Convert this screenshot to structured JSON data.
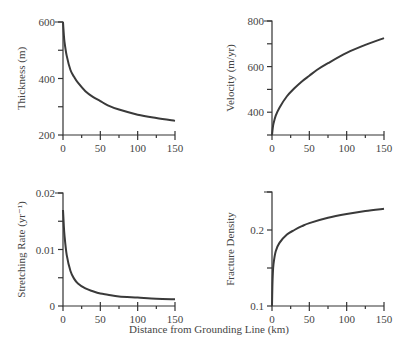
{
  "figure": {
    "shared_xlabel": "Distance from Grounding Line (km)"
  },
  "chart_data": [
    {
      "type": "line",
      "title": "",
      "xlabel": "Distance from Grounding Line (km)",
      "ylabel": "Thickness (m)",
      "xlim": [
        0,
        150
      ],
      "ylim": [
        200,
        600
      ],
      "xticks": [
        "0",
        "50",
        "100",
        "150"
      ],
      "yticks": [
        "200",
        "400",
        "600"
      ],
      "grid": false,
      "x": [
        0,
        1,
        2,
        5,
        10,
        15,
        20,
        30,
        40,
        50,
        60,
        75,
        100,
        125,
        150
      ],
      "y": [
        600,
        560,
        530,
        480,
        430,
        405,
        385,
        355,
        335,
        320,
        305,
        290,
        272,
        260,
        250
      ]
    },
    {
      "type": "line",
      "title": "",
      "xlabel": "Distance from Grounding Line (km)",
      "ylabel": "Velocity (m/yr)",
      "xlim": [
        0,
        150
      ],
      "ylim": [
        300,
        800
      ],
      "xticks": [
        "0",
        "50",
        "100",
        "150"
      ],
      "yticks": [
        "400",
        "600",
        "800"
      ],
      "grid": false,
      "x": [
        0,
        1,
        2,
        5,
        10,
        20,
        30,
        40,
        50,
        60,
        75,
        100,
        125,
        150
      ],
      "y": [
        300,
        330,
        350,
        385,
        420,
        470,
        505,
        535,
        560,
        585,
        615,
        660,
        695,
        725
      ]
    },
    {
      "type": "line",
      "title": "",
      "xlabel": "Distance from Grounding Line (km)",
      "ylabel": "Stretching Rate (yr⁻¹)",
      "xlim": [
        0,
        150
      ],
      "ylim": [
        0,
        0.02
      ],
      "xticks": [
        "0",
        "50",
        "100",
        "150"
      ],
      "yticks": [
        "0",
        "0.01",
        "0.02"
      ],
      "grid": false,
      "x": [
        0,
        1,
        2,
        5,
        10,
        15,
        20,
        30,
        40,
        50,
        60,
        75,
        100,
        125,
        150
      ],
      "y": [
        0.017,
        0.0145,
        0.0125,
        0.009,
        0.0062,
        0.0048,
        0.004,
        0.0031,
        0.0026,
        0.0022,
        0.002,
        0.0017,
        0.0015,
        0.0013,
        0.0012
      ]
    },
    {
      "type": "line",
      "title": "",
      "xlabel": "Distance from Grounding Line (km)",
      "ylabel": "Fracture Density",
      "xlim": [
        0,
        150
      ],
      "ylim": [
        0.1,
        0.25
      ],
      "xticks": [
        "0",
        "50",
        "100",
        "150"
      ],
      "yticks": [
        "0.1",
        "0.2"
      ],
      "grid": false,
      "x": [
        0,
        0.5,
        1,
        2,
        5,
        10,
        20,
        30,
        40,
        50,
        75,
        100,
        125,
        150
      ],
      "y": [
        0.1,
        0.125,
        0.14,
        0.155,
        0.172,
        0.183,
        0.194,
        0.2,
        0.205,
        0.209,
        0.216,
        0.221,
        0.225,
        0.228
      ]
    }
  ]
}
